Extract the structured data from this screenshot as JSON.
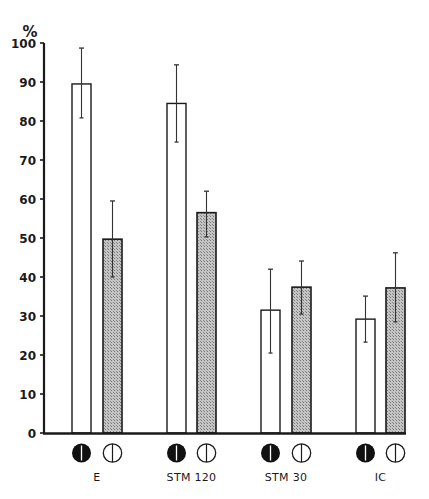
{
  "chart_data": {
    "type": "bar",
    "title": "",
    "xlabel": "",
    "ylabel": "%",
    "ylim": [
      0,
      100
    ],
    "yticks": [
      0,
      10,
      20,
      30,
      40,
      50,
      60,
      70,
      80,
      90,
      100
    ],
    "grid": false,
    "legend_position": "below each category (icons)",
    "categories": [
      "E",
      "STM 120",
      "STM 30",
      "IC"
    ],
    "series": [
      {
        "name": "filled-circle condition",
        "marker": "filled black circle with white vertical line",
        "fill": "white",
        "values": [
          89.5,
          84.5,
          31.5,
          29.2
        ],
        "error_upper": [
          98.7,
          94.4,
          42.0,
          35.1
        ],
        "error_lower": [
          80.8,
          74.6,
          20.5,
          23.3
        ]
      },
      {
        "name": "open-circle condition",
        "marker": "open circle with vertical line",
        "fill": "gray hatched",
        "values": [
          49.7,
          56.5,
          37.4,
          37.2
        ],
        "error_upper": [
          59.5,
          62.0,
          44.1,
          46.2
        ],
        "error_lower": [
          40.0,
          50.3,
          30.5,
          28.5
        ]
      }
    ]
  },
  "axis": {
    "unit": "%",
    "ticks": [
      "0",
      "10",
      "20",
      "30",
      "40",
      "50",
      "60",
      "70",
      "80",
      "90",
      "100"
    ]
  },
  "labels": {
    "categories": [
      "E",
      "STM 120",
      "STM 30",
      "IC"
    ]
  },
  "colors": {
    "axis": "#1a1a1a",
    "white_bar": "#ffffff",
    "gray_bar": "#b8b8b8",
    "filled_icon": "#111111"
  }
}
